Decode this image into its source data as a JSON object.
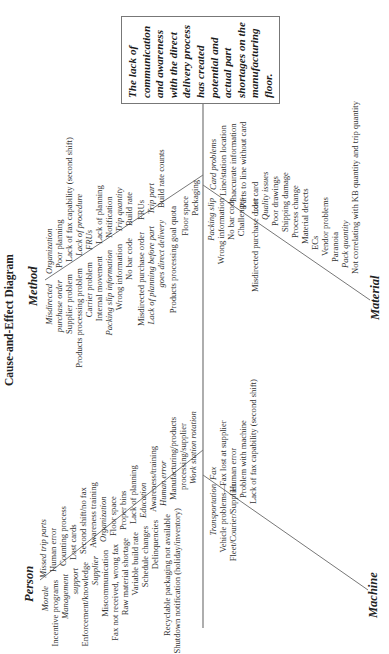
{
  "title": "Cause-and-Effect Diagram",
  "effect": "The lack of communication and awareness with the direct delivery process has created potential and actual part shortages on the manufacturing floor.",
  "categories": {
    "method": "Method",
    "person": "Person",
    "material": "Material",
    "machine": "Machine"
  },
  "method": {
    "left_column": [
      {
        "text": "Misdirected",
        "italic": true
      },
      {
        "text": "purchase order",
        "italic": true
      },
      {
        "text": "Supplier problem",
        "italic": false
      },
      {
        "text": "Products processing problem",
        "italic": false
      },
      {
        "text": "Carrier problem",
        "italic": false
      },
      {
        "text": "Internal movement",
        "italic": false
      },
      {
        "text": "Packing slip information",
        "italic": true
      },
      {
        "text": "Wrong information",
        "italic": false
      },
      {
        "text": "No bar code",
        "italic": false
      },
      {
        "text": "Misdirected purchase order",
        "italic": false
      },
      {
        "text": "Lack of planning before part",
        "italic": true
      },
      {
        "text": "goes direct delivery",
        "italic": true
      },
      {
        "text": "Products processing goal quota",
        "italic": false
      },
      {
        "text": "Floor space",
        "italic": false
      },
      {
        "text": "Packaging",
        "italic": false
      }
    ],
    "right_column": [
      {
        "text": "Organization",
        "italic": true
      },
      {
        "text": "Poor planning",
        "italic": false
      },
      {
        "text": "Lack of fax capability (second shift)",
        "italic": false
      },
      {
        "text": "Lack of procedure",
        "italic": true
      },
      {
        "text": "FRUs",
        "italic": true
      },
      {
        "text": "Lack of planning",
        "italic": false
      },
      {
        "text": "Notification",
        "italic": false
      },
      {
        "text": "Trip quantity",
        "italic": true
      },
      {
        "text": "Build rate",
        "italic": false
      },
      {
        "text": "FRUs",
        "italic": false
      },
      {
        "text": "Trip part",
        "italic": true
      },
      {
        "text": "Build rate counts",
        "italic": false
      }
    ]
  },
  "person": {
    "left_column": [
      {
        "text": "Morale",
        "italic": true
      },
      {
        "text": "Incentive programs",
        "italic": false
      },
      {
        "text": "Management",
        "italic": true
      },
      {
        "text": "support",
        "italic": true
      },
      {
        "text": "Enforcement/knowledge",
        "italic": false
      },
      {
        "text": "Supplier",
        "italic": true
      },
      {
        "text": "Miscommunication",
        "italic": false
      },
      {
        "text": "Fax not received, wrong fax",
        "italic": false
      },
      {
        "text": "Raw material shortage",
        "italic": false
      },
      {
        "text": "Variable build rate",
        "italic": false
      },
      {
        "text": "Schedule changes",
        "italic": false
      },
      {
        "text": "Delinquencies",
        "italic": false
      },
      {
        "text": "Recyclable packaging not available",
        "italic": false
      },
      {
        "text": "Shutdown notification (holiday/inventory)",
        "italic": false
      }
    ],
    "right_column": [
      {
        "text": "Missed trip parts",
        "italic": true
      },
      {
        "text": "Human error",
        "italic": false
      },
      {
        "text": "Counting process",
        "italic": false
      },
      {
        "text": "Lost cards",
        "italic": false
      },
      {
        "text": "Second shift/no fax",
        "italic": false
      },
      {
        "text": "Awareness training",
        "italic": false
      },
      {
        "text": "Organization",
        "italic": true
      },
      {
        "text": "Floor space",
        "italic": false
      },
      {
        "text": "Proper bins",
        "italic": false
      },
      {
        "text": "Lack of planning",
        "italic": false
      },
      {
        "text": "Education",
        "italic": true
      },
      {
        "text": "Awareness/training",
        "italic": false
      },
      {
        "text": "Human error",
        "italic": true
      },
      {
        "text": "Manufacturing/products",
        "italic": false
      },
      {
        "text": "processing/supplier",
        "italic": false
      },
      {
        "text": "Work station rotation",
        "italic": true
      }
    ]
  },
  "material": {
    "left_column": [
      {
        "text": "Packing slip",
        "italic": true
      },
      {
        "text": "Wrong information",
        "italic": false
      },
      {
        "text": "No bar code",
        "italic": false
      },
      {
        "text": "Challenges",
        "italic": false
      },
      {
        "text": "Misdirected purchase order",
        "italic": false
      }
    ],
    "right_column": [
      {
        "text": "Card problems",
        "italic": true
      },
      {
        "text": "Line/station location",
        "italic": false
      },
      {
        "text": "Inaccurate information",
        "italic": false
      },
      {
        "text": "Parts to line without card",
        "italic": false
      },
      {
        "text": "Lost card",
        "italic": false
      },
      {
        "text": "Quality issues",
        "italic": true
      },
      {
        "text": "Poor drawings",
        "italic": false
      },
      {
        "text": "Shipping damage",
        "italic": false
      },
      {
        "text": "Process change",
        "italic": false
      },
      {
        "text": "Material defects",
        "italic": false
      },
      {
        "text": "ECs",
        "italic": false
      },
      {
        "text": "Vendor problems",
        "italic": false
      },
      {
        "text": "Paranoia",
        "italic": false
      },
      {
        "text": "Pack quantity",
        "italic": true
      },
      {
        "text": "Not correlating with KB quantity and trip quantity",
        "italic": false
      }
    ]
  },
  "machine": {
    "left_column": [
      {
        "text": "Transportation",
        "italic": true
      },
      {
        "text": "Vehicle problems—",
        "italic": false
      },
      {
        "text": "Fleet/Courier/Supplier",
        "italic": false
      }
    ],
    "right_column": [
      {
        "text": "Fax",
        "italic": true
      },
      {
        "text": "Fax lost at supplier",
        "italic": false
      },
      {
        "text": "Human error",
        "italic": false
      },
      {
        "text": "Problem with machine",
        "italic": false
      },
      {
        "text": "Lack of fax capability (second shift)",
        "italic": false
      }
    ]
  }
}
